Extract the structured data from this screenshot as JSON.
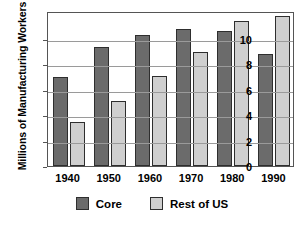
{
  "chart_data": {
    "type": "bar",
    "title": "",
    "xlabel": "",
    "ylabel": "Millions of Manufacturing Workers",
    "categories": [
      "1940",
      "1950",
      "1960",
      "1970",
      "1980",
      "1990"
    ],
    "series": [
      {
        "name": "Core",
        "color": "#6b6b6b",
        "values": [
          7.0,
          9.4,
          10.3,
          10.8,
          10.6,
          8.8
        ]
      },
      {
        "name": "Rest of US",
        "color": "#cfcfcf",
        "values": [
          3.5,
          5.1,
          7.1,
          9.0,
          11.4,
          11.8
        ]
      }
    ],
    "ylim": [
      0,
      12.2
    ],
    "yticks": [
      0,
      2,
      4,
      6,
      8,
      10
    ],
    "ytick_labels": [
      "0",
      "2",
      "4",
      "6",
      "8",
      "10"
    ],
    "grid": true,
    "legend_position": "bottom"
  },
  "legend": {
    "items": [
      {
        "label": "Core",
        "swatch": "core-swatch"
      },
      {
        "label": "Rest of US",
        "swatch": "rest-of-us-swatch"
      }
    ]
  }
}
